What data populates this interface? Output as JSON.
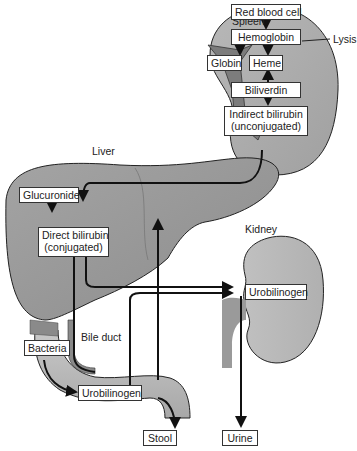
{
  "colors": {
    "organ_light": "#c8c8c8",
    "organ_mid": "#a8a8a8",
    "organ_dark": "#8a8a8a",
    "stroke": "#222222",
    "box_bg": "#ffffff"
  },
  "organs": {
    "spleen": "Spleen",
    "liver": "Liver",
    "kidney": "Kidney",
    "bile_duct": "Bile duct"
  },
  "annotations": {
    "lysis": "Lysis"
  },
  "nodes": {
    "red_blood_cell": "Red blood cell",
    "hemoglobin": "Hemoglobin",
    "globin": "Globin",
    "heme": "Heme",
    "biliverdin": "Biliverdin",
    "indirect_bilirubin_1": "Indirect bilirubin",
    "indirect_bilirubin_2": "(unconjugated)",
    "glucuronide": "Glucuronide",
    "direct_bilirubin_1": "Direct bilirubin",
    "direct_bilirubin_2": "(conjugated)",
    "bacteria": "Bacteria",
    "urobilinogen_intestine": "Urobilinogen",
    "urobilinogen_kidney": "Urobilinogen",
    "stool": "Stool",
    "urine": "Urine"
  },
  "flows": [
    {
      "from": "Red blood cell",
      "to": "Hemoglobin"
    },
    {
      "from": "Hemoglobin",
      "to": "Globin"
    },
    {
      "from": "Hemoglobin",
      "to": "Heme"
    },
    {
      "from": "Heme",
      "to": "Biliverdin"
    },
    {
      "from": "Biliverdin",
      "to": "Indirect bilirubin (unconjugated)"
    },
    {
      "from": "Indirect bilirubin (unconjugated)",
      "to": "Direct bilirubin (conjugated)"
    },
    {
      "from": "Glucuronide",
      "to": "Direct bilirubin (conjugated)"
    },
    {
      "from": "Direct bilirubin (conjugated)",
      "to": "Urobilinogen (intestine)"
    },
    {
      "from": "Bacteria",
      "to": "Urobilinogen (intestine)"
    },
    {
      "from": "Direct bilirubin (conjugated)",
      "to": "Urobilinogen (kidney)"
    },
    {
      "from": "Urobilinogen (intestine)",
      "to": "Liver"
    },
    {
      "from": "Urobilinogen (intestine)",
      "to": "Urobilinogen (kidney)"
    },
    {
      "from": "Urobilinogen (intestine)",
      "to": "Stool"
    },
    {
      "from": "Urobilinogen (kidney)",
      "to": "Urine"
    }
  ]
}
